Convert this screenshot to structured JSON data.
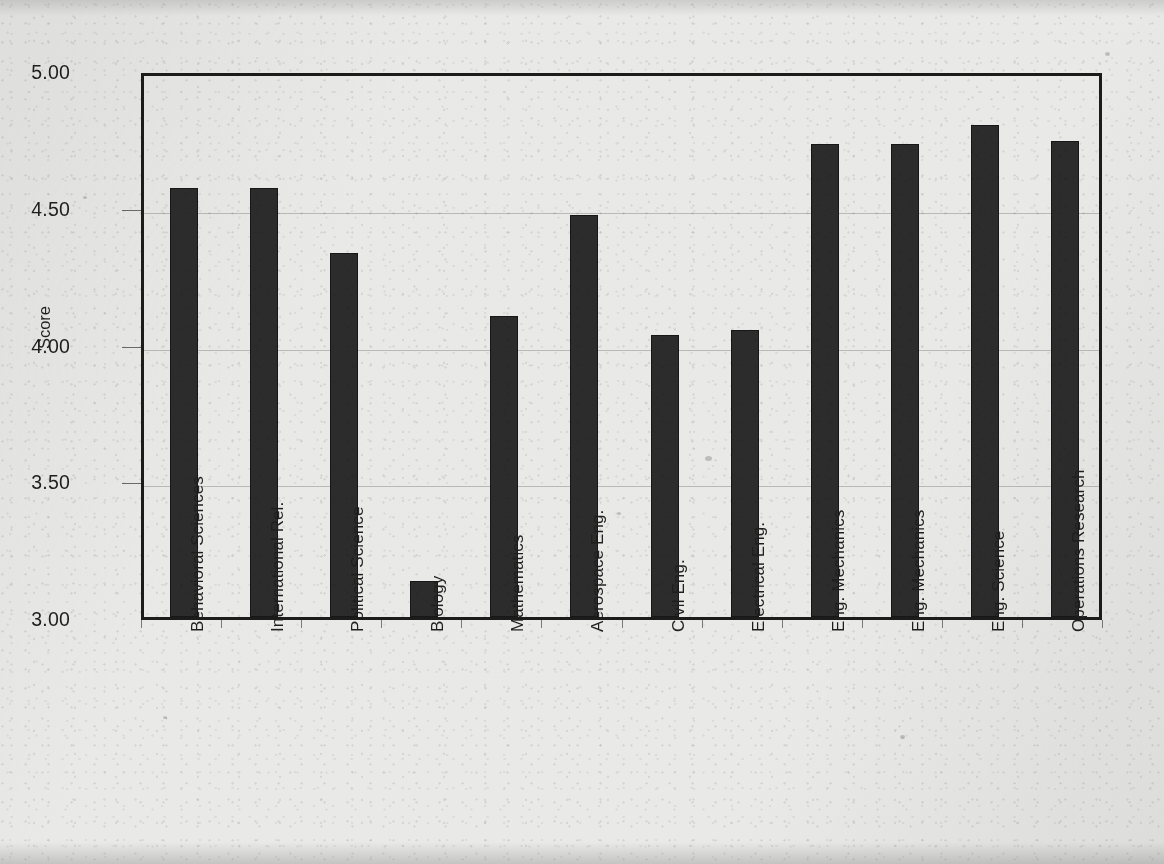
{
  "chart_data": {
    "type": "bar",
    "title": "",
    "xlabel": "",
    "ylabel": "Score",
    "ylim": [
      3.0,
      5.0
    ],
    "ytick_labels": [
      "5.00",
      "4.50",
      "4.00",
      "3.50",
      "3.00"
    ],
    "ytick_values": [
      5.0,
      4.5,
      4.0,
      3.5,
      3.0
    ],
    "grid": true,
    "legend": "none",
    "bar_color": "#2c2c2c",
    "categories": [
      "Behavioral Sciences",
      "International Rel.",
      "Political  Science",
      "Biology",
      "Mathematics",
      "Aerospace Eng.",
      "Civil Eng.",
      "Electrical Eng.",
      "Eng. Mechanics",
      "Eng. Mechanics",
      "Eng. Science",
      "Operations Research"
    ],
    "values": [
      4.57,
      4.57,
      4.33,
      3.13,
      4.1,
      4.47,
      4.03,
      4.05,
      4.73,
      4.73,
      4.8,
      4.74
    ]
  },
  "colors": {
    "background": "#e9e9e7",
    "bar": "#2c2c2c",
    "axis": "#1c1c1c",
    "gridline": "#b9b9b7",
    "text": "#1f1f1f"
  }
}
